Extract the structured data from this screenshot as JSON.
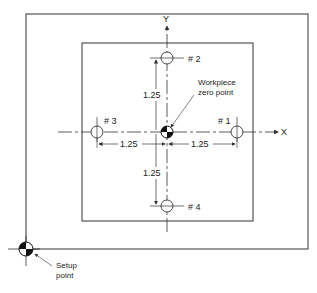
{
  "diagram": {
    "axes": {
      "x_label": "X",
      "y_label": "Y"
    },
    "holes": [
      {
        "id": "1",
        "label": "# 1",
        "x": 1.25,
        "y": 0
      },
      {
        "id": "2",
        "label": "# 2",
        "x": 0,
        "y": 1.25
      },
      {
        "id": "3",
        "label": "# 3",
        "x": -1.25,
        "y": 0
      },
      {
        "id": "4",
        "label": "# 4",
        "x": 0,
        "y": -1.25
      }
    ],
    "dimensions": {
      "left": "1.25",
      "right": "1.25",
      "up": "1.25",
      "down": "1.25"
    },
    "callouts": {
      "workpiece_zero_line1": "Workpiece",
      "workpiece_zero_line2": "zero point",
      "setup_line1": "Setup",
      "setup_line2": "point"
    },
    "colors": {
      "line": "#333333",
      "background": "#ffffff"
    }
  }
}
